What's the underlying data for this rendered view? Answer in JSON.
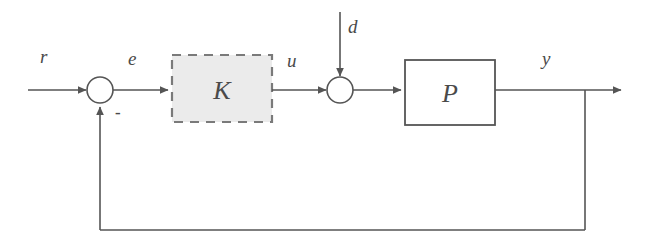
{
  "diagram": {
    "type": "control-system-block-diagram",
    "colors": {
      "line": "#555555",
      "text": "#4a4a4a",
      "controller_fill": "#ebebeb",
      "controller_stroke": "#7a7a7a",
      "plant_fill": "#ffffff",
      "plant_stroke": "#555555",
      "background": "#ffffff"
    },
    "blocks": [
      {
        "id": "controller",
        "label": "K",
        "style": "dashed",
        "fill": "#ebebeb",
        "x": 172,
        "y": 55,
        "width": 100,
        "height": 67
      },
      {
        "id": "plant",
        "label": "P",
        "style": "solid",
        "fill": "#ffffff",
        "x": 405,
        "y": 60,
        "width": 90,
        "height": 65
      }
    ],
    "junctions": [
      {
        "id": "error-sum",
        "cx": 100,
        "cy": 90,
        "r": 13,
        "sign": "-",
        "sign_x": 115,
        "sign_y": 104
      },
      {
        "id": "disturbance-sum",
        "cx": 340,
        "cy": 90,
        "r": 13
      }
    ],
    "signals": [
      {
        "id": "reference",
        "label": "r",
        "x": 40,
        "y": 46
      },
      {
        "id": "error",
        "label": "e",
        "x": 128,
        "y": 48
      },
      {
        "id": "control",
        "label": "u",
        "x": 287,
        "y": 50
      },
      {
        "id": "disturbance",
        "label": "d",
        "x": 348,
        "y": 16
      },
      {
        "id": "output",
        "label": "y",
        "x": 542,
        "y": 48
      }
    ]
  }
}
